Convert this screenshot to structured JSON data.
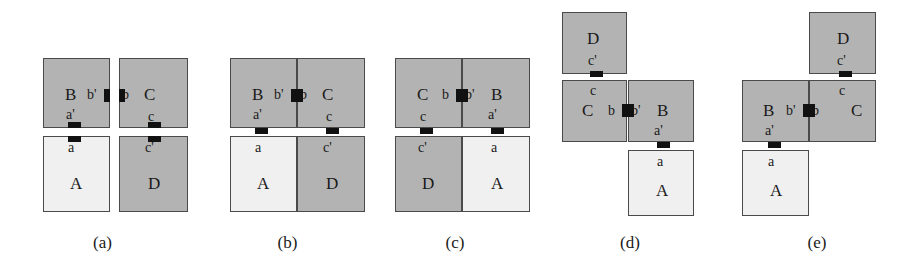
{
  "figure": {
    "colors": {
      "gray_tile": "#b3b3b3",
      "light_tile": "#f0f0f0",
      "tile_border": "#4a4a4a",
      "connector": "#111111",
      "background": "#ffffff"
    },
    "tile_letters": [
      "A",
      "B",
      "C",
      "D"
    ],
    "edge_letters": [
      "a",
      "a'",
      "b",
      "b'",
      "c",
      "c'"
    ]
  },
  "panels": [
    {
      "caption": "(a)",
      "tiles": [
        {
          "name": "B",
          "shade": "gray"
        },
        {
          "name": "C",
          "shade": "gray"
        },
        {
          "name": "A",
          "shade": "light"
        },
        {
          "name": "D",
          "shade": "gray"
        }
      ],
      "edges": [
        {
          "label": "b'"
        },
        {
          "label": "b"
        },
        {
          "label": "a'"
        },
        {
          "label": "a"
        },
        {
          "label": "c"
        },
        {
          "label": "c'"
        }
      ]
    },
    {
      "caption": "(b)",
      "tiles": [
        {
          "name": "B",
          "shade": "gray"
        },
        {
          "name": "C",
          "shade": "gray"
        },
        {
          "name": "A",
          "shade": "light"
        },
        {
          "name": "D",
          "shade": "gray"
        }
      ],
      "edges": [
        {
          "label": "b'"
        },
        {
          "label": "b"
        },
        {
          "label": "a'"
        },
        {
          "label": "a"
        },
        {
          "label": "c"
        },
        {
          "label": "c'"
        }
      ]
    },
    {
      "caption": "(c)",
      "tiles": [
        {
          "name": "C",
          "shade": "gray"
        },
        {
          "name": "B",
          "shade": "gray"
        },
        {
          "name": "D",
          "shade": "gray"
        },
        {
          "name": "A",
          "shade": "light"
        }
      ],
      "edges": [
        {
          "label": "b"
        },
        {
          "label": "b'"
        },
        {
          "label": "c"
        },
        {
          "label": "c'"
        },
        {
          "label": "a'"
        },
        {
          "label": "a"
        }
      ]
    },
    {
      "caption": "(d)",
      "tiles": [
        {
          "name": "D",
          "shade": "gray"
        },
        {
          "name": "C",
          "shade": "gray"
        },
        {
          "name": "B",
          "shade": "gray"
        },
        {
          "name": "A",
          "shade": "light"
        }
      ],
      "edges": [
        {
          "label": "c'"
        },
        {
          "label": "c"
        },
        {
          "label": "b"
        },
        {
          "label": "b'"
        },
        {
          "label": "a'"
        },
        {
          "label": "a"
        }
      ]
    },
    {
      "caption": "(e)",
      "tiles": [
        {
          "name": "D",
          "shade": "gray"
        },
        {
          "name": "C",
          "shade": "gray"
        },
        {
          "name": "B",
          "shade": "gray"
        },
        {
          "name": "A",
          "shade": "light"
        }
      ],
      "edges": [
        {
          "label": "c'"
        },
        {
          "label": "c"
        },
        {
          "label": "b'"
        },
        {
          "label": "b"
        },
        {
          "label": "a'"
        },
        {
          "label": "a"
        }
      ]
    }
  ]
}
